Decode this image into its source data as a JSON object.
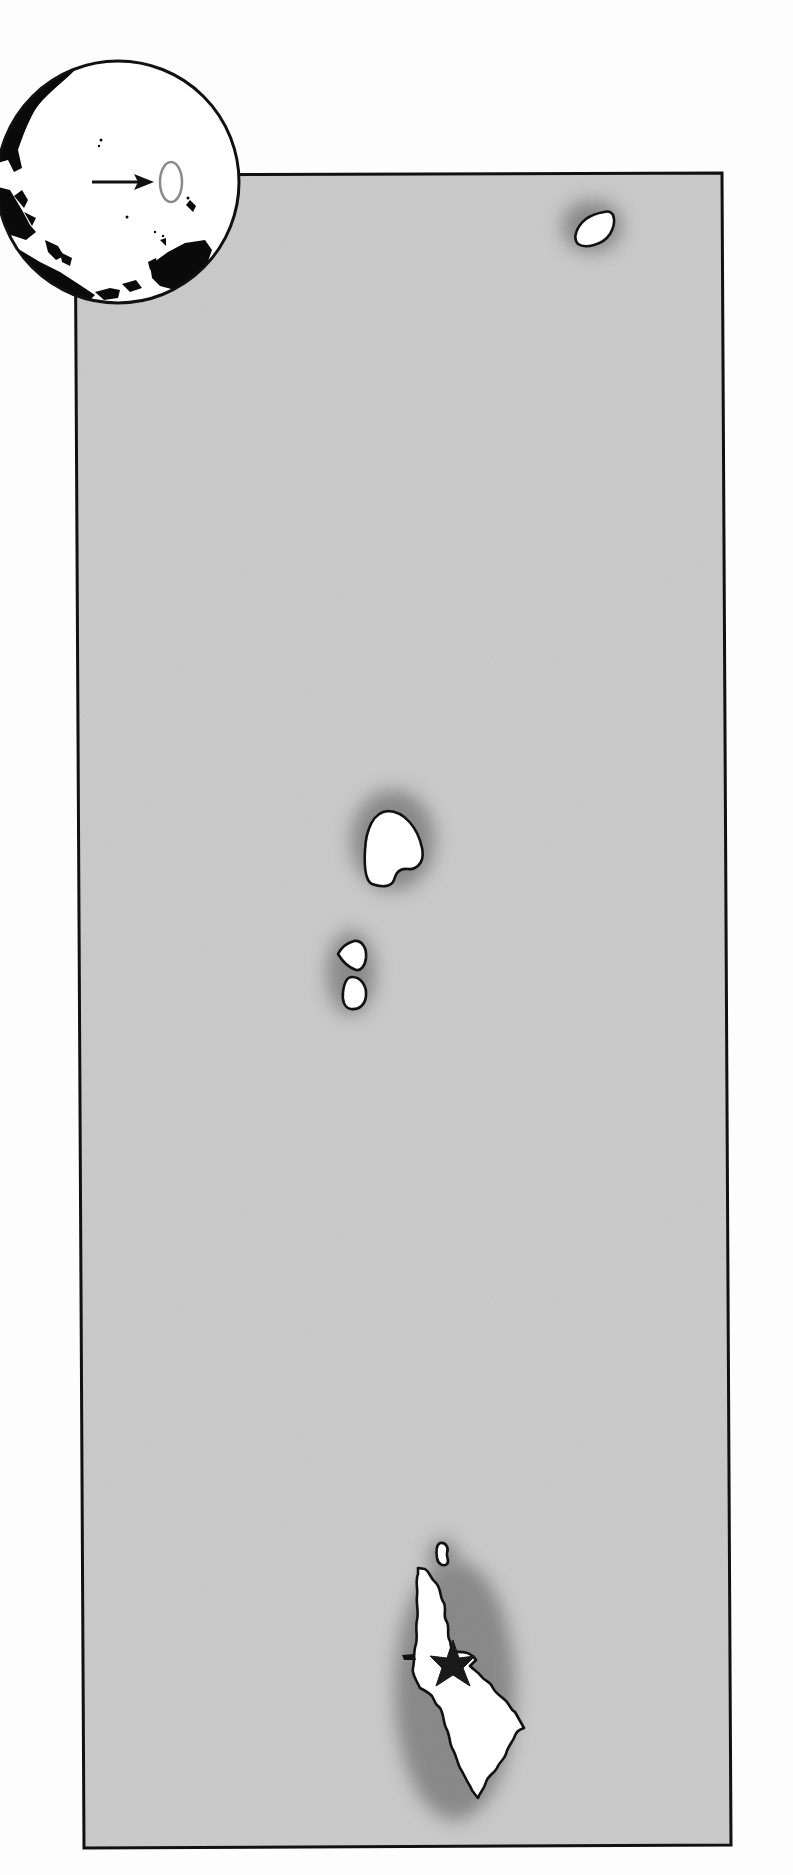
{
  "map": {
    "type": "locator-map",
    "ocean_color": "#c4c4c4",
    "land_color": "#ffffff",
    "outline_color": "#111111",
    "frame": {
      "top_left": [
        75,
        175
      ],
      "top_right": [
        722,
        173
      ],
      "bottom_right": [
        731,
        1845
      ],
      "bottom_left": [
        84,
        1848
      ]
    },
    "islands": [
      {
        "name": "island-north",
        "cx": 590,
        "cy": 225
      },
      {
        "name": "island-large-central",
        "cx": 393,
        "cy": 840
      },
      {
        "name": "island-small-upper",
        "cx": 351,
        "cy": 953
      },
      {
        "name": "island-small-lower",
        "cx": 352,
        "cy": 995
      },
      {
        "name": "island-tiny-south",
        "cx": 443,
        "cy": 1554
      },
      {
        "name": "island-main-south",
        "cx": 460,
        "cy": 1690
      }
    ],
    "capital_marker": {
      "symbol": "star",
      "color": "#1a1a1a",
      "x": 453,
      "y": 1665
    }
  },
  "inset_globe": {
    "center": [
      118,
      182
    ],
    "radius": 122,
    "highlight_ellipse": {
      "cx": 171,
      "cy": 182,
      "rx": 11,
      "ry": 20,
      "color": "#8a8a8a"
    },
    "arrow": {
      "from": [
        92,
        182
      ],
      "to": [
        152,
        182
      ]
    }
  }
}
